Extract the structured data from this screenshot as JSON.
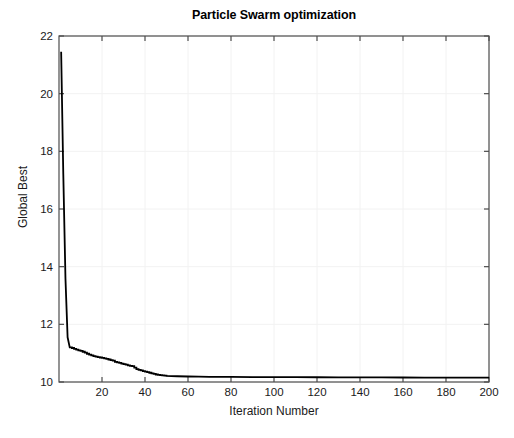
{
  "chart_data": {
    "type": "line",
    "title": "Particle Swarm optimization",
    "xlabel": "Iteration Number",
    "ylabel": "Global Best",
    "xlim": [
      0,
      200
    ],
    "ylim": [
      10,
      22
    ],
    "xticks": [
      20,
      40,
      60,
      80,
      100,
      120,
      140,
      160,
      180,
      200
    ],
    "yticks": [
      10,
      12,
      14,
      16,
      18,
      20,
      22
    ],
    "grid": true,
    "legend": null,
    "line_color": "#000000",
    "line_width": 1.8,
    "series": [
      {
        "name": "Global Best",
        "x": [
          1,
          2,
          3,
          4,
          5,
          6,
          7,
          8,
          9,
          10,
          11,
          12,
          13,
          14,
          15,
          16,
          17,
          18,
          19,
          20,
          21,
          22,
          23,
          24,
          25,
          26,
          27,
          28,
          29,
          30,
          31,
          32,
          33,
          34,
          35,
          36,
          37,
          38,
          39,
          40,
          41,
          42,
          43,
          44,
          45,
          46,
          47,
          48,
          49,
          50,
          55,
          60,
          65,
          70,
          80,
          90,
          100,
          110,
          120,
          130,
          140,
          150,
          160,
          170,
          180,
          190,
          200
        ],
        "values": [
          21.45,
          17.2,
          13.6,
          11.55,
          11.2,
          11.18,
          11.15,
          11.12,
          11.1,
          11.08,
          11.05,
          11.02,
          10.98,
          10.95,
          10.92,
          10.9,
          10.88,
          10.86,
          10.85,
          10.84,
          10.82,
          10.8,
          10.78,
          10.76,
          10.74,
          10.7,
          10.68,
          10.66,
          10.64,
          10.62,
          10.6,
          10.58,
          10.56,
          10.55,
          10.5,
          10.45,
          10.42,
          10.4,
          10.38,
          10.36,
          10.34,
          10.32,
          10.3,
          10.28,
          10.26,
          10.25,
          10.24,
          10.23,
          10.22,
          10.21,
          10.2,
          10.19,
          10.185,
          10.18,
          10.175,
          10.17,
          10.168,
          10.166,
          10.164,
          10.162,
          10.16,
          10.158,
          10.156,
          10.155,
          10.154,
          10.152,
          10.15
        ]
      }
    ]
  }
}
